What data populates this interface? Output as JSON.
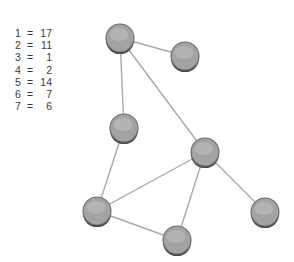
{
  "canvas": {
    "width": 294,
    "height": 262,
    "background": "#ffffff"
  },
  "legend": {
    "name": "node-value-legend",
    "rows": [
      {
        "key": "1",
        "eq": "=",
        "value": "17"
      },
      {
        "key": "2",
        "eq": "=",
        "value": "11"
      },
      {
        "key": "3",
        "eq": "=",
        "value": "1"
      },
      {
        "key": "4",
        "eq": "=",
        "value": "2"
      },
      {
        "key": "5",
        "eq": "=",
        "value": "14"
      },
      {
        "key": "6",
        "eq": "=",
        "value": "7"
      },
      {
        "key": "7",
        "eq": "=",
        "value": "6"
      }
    ]
  },
  "graph": {
    "node_fill": "#a3a3a3",
    "node_stroke": "#6d6d6d",
    "node_shadow": "#4a4a4a",
    "edge_color": "#a9a9a9",
    "node_radius": 14,
    "nodes": [
      {
        "id": "1",
        "label": "",
        "cx": 120,
        "cy": 38
      },
      {
        "id": "2",
        "label": "",
        "cx": 185,
        "cy": 56
      },
      {
        "id": "3",
        "label": "",
        "cx": 124,
        "cy": 128
      },
      {
        "id": "4",
        "label": "",
        "cx": 205,
        "cy": 152
      },
      {
        "id": "5",
        "label": "",
        "cx": 97,
        "cy": 211
      },
      {
        "id": "6",
        "label": "",
        "cx": 177,
        "cy": 240
      },
      {
        "id": "7",
        "label": "",
        "cx": 265,
        "cy": 212
      }
    ],
    "edges": [
      {
        "from": "1",
        "to": "2",
        "x1": 120,
        "y1": 38,
        "x2": 185,
        "y2": 56
      },
      {
        "from": "1",
        "to": "3",
        "x1": 120,
        "y1": 38,
        "x2": 124,
        "y2": 128
      },
      {
        "from": "1",
        "to": "4",
        "x1": 120,
        "y1": 38,
        "x2": 205,
        "y2": 152
      },
      {
        "from": "3",
        "to": "5",
        "x1": 124,
        "y1": 128,
        "x2": 97,
        "y2": 211
      },
      {
        "from": "4",
        "to": "5",
        "x1": 205,
        "y1": 152,
        "x2": 97,
        "y2": 211
      },
      {
        "from": "4",
        "to": "6",
        "x1": 205,
        "y1": 152,
        "x2": 177,
        "y2": 240
      },
      {
        "from": "4",
        "to": "7",
        "x1": 205,
        "y1": 152,
        "x2": 265,
        "y2": 212
      },
      {
        "from": "5",
        "to": "6",
        "x1": 97,
        "y1": 211,
        "x2": 177,
        "y2": 240
      }
    ]
  }
}
